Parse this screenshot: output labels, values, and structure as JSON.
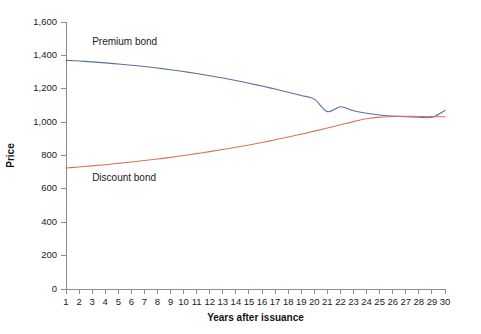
{
  "chart_data": {
    "type": "line",
    "title": "",
    "xlabel": "Years after issuance",
    "ylabel": "Price",
    "xlim": [
      1,
      30
    ],
    "ylim": [
      0,
      1600
    ],
    "grid": false,
    "legend_position": "inline-annotation",
    "x": [
      1,
      2,
      3,
      4,
      5,
      6,
      7,
      8,
      9,
      10,
      11,
      12,
      13,
      14,
      15,
      16,
      17,
      18,
      19,
      20,
      21,
      22,
      23,
      24,
      25,
      26,
      27,
      28,
      29,
      30
    ],
    "xticklabels": [
      "1",
      "2",
      "3",
      "4",
      "5",
      "6",
      "7",
      "8",
      "9",
      "10",
      "11",
      "12",
      "13",
      "14",
      "15",
      "16",
      "17",
      "18",
      "19",
      "20",
      "21",
      "22",
      "23",
      "24",
      "25",
      "26",
      "27",
      "28",
      "29",
      "30"
    ],
    "yticks": [
      0,
      200,
      400,
      600,
      800,
      1000,
      1200,
      1400,
      1600
    ],
    "yticklabels": [
      "0",
      "200",
      "400",
      "600",
      "800",
      "1,000",
      "1,200",
      "1,400",
      "1,600"
    ],
    "series": [
      {
        "name": "Premium bond",
        "color": "#5b6f9e",
        "label_x": 3.0,
        "label_y": 1465,
        "values": [
          1370,
          1366,
          1361,
          1355,
          1348,
          1341,
          1333,
          1324,
          1314,
          1303,
          1291,
          1278,
          1264,
          1249,
          1233,
          1216,
          1198,
          1179,
          1159,
          1138,
          1063,
          1092,
          1068,
          1053,
          1043,
          1036,
          1032,
          1030,
          1029,
          1070
        ]
      },
      {
        "name": "Discount bond",
        "color": "#e0705c",
        "label_x": 3.0,
        "label_y": 650,
        "values": [
          725,
          731,
          738,
          745,
          753,
          761,
          770,
          779,
          789,
          800,
          811,
          823,
          836,
          849,
          863,
          878,
          894,
          911,
          928,
          946,
          965,
          984,
          1003,
          1020,
          1030,
          1034,
          1035,
          1034,
          1033,
          1032
        ]
      }
    ]
  }
}
